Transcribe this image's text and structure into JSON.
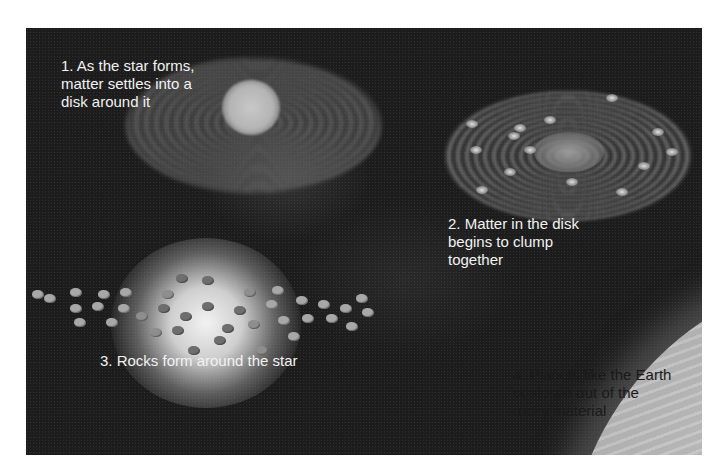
{
  "figure": {
    "colors": {
      "background": "#ffffff",
      "space": "#1c1c1c",
      "planet": "#b4b4b4",
      "label_light": "#f2f2f2",
      "label_dark": "#1a1a1a"
    },
    "stages": [
      {
        "number": "1",
        "label": "1. As the star forms,\nmatter settles into a\ndisk around it"
      },
      {
        "number": "2",
        "label": "2. Matter in the disk\nbegins to clump\ntogether"
      },
      {
        "number": "3",
        "label": "3. Rocks form around the star"
      },
      {
        "number": "4",
        "label": "4. Planets like the Earth\ncoalesce out of the\nrocky material"
      }
    ]
  }
}
